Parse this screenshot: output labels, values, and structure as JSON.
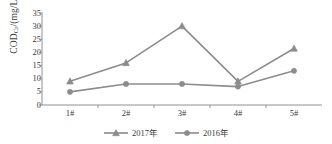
{
  "chart_data": {
    "type": "line",
    "title": "",
    "xlabel": "",
    "ylabel": "CODCr/(mg/L)",
    "ylabel_main": "COD",
    "ylabel_sub": "Cr",
    "ylabel_unit": "/(mg/L)",
    "categories": [
      "1#",
      "2#",
      "3#",
      "4#",
      "5#"
    ],
    "ylim": [
      0,
      35
    ],
    "yticks": [
      0,
      5,
      10,
      15,
      20,
      25,
      30,
      35
    ],
    "ytick_labels": [
      "0",
      "5",
      "10",
      "15",
      "20",
      "25",
      "30",
      "35"
    ],
    "grid": false,
    "legend_position": "bottom",
    "series": [
      {
        "name": "2017年",
        "marker": "triangle",
        "color": "#8c8c8c",
        "values": [
          9,
          16,
          30,
          9,
          21.5
        ]
      },
      {
        "name": "2016年",
        "marker": "circle",
        "color": "#8c8c8c",
        "values": [
          5,
          8,
          8,
          7,
          13
        ]
      }
    ]
  },
  "axes": {
    "line_color": "#909090",
    "tick_color": "#909090"
  }
}
